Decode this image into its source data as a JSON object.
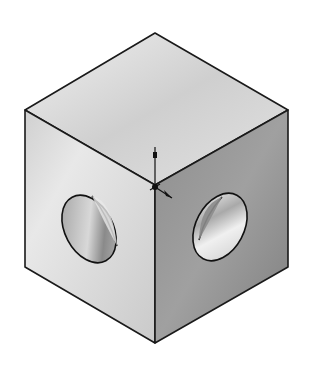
{
  "scene": {
    "description": "Isometric shaded view of a cube with through holes on two visible side faces",
    "background": "#ffffff",
    "outline_color": "#1a1a1a",
    "faces": {
      "top": {
        "fill_light": "#e6e6e6",
        "fill_dark": "#bdbdbd"
      },
      "left": {
        "fill_light": "#e4e4e4",
        "fill_dark": "#c4c4c4"
      },
      "right": {
        "fill_light": "#9a9a9a",
        "fill_dark": "#7c7c7c"
      }
    },
    "holes": [
      {
        "face": "left",
        "label": "left-face-hole"
      },
      {
        "face": "right",
        "label": "right-face-hole"
      }
    ],
    "origin_triad": {
      "label": "origin",
      "color": "#111111"
    }
  }
}
